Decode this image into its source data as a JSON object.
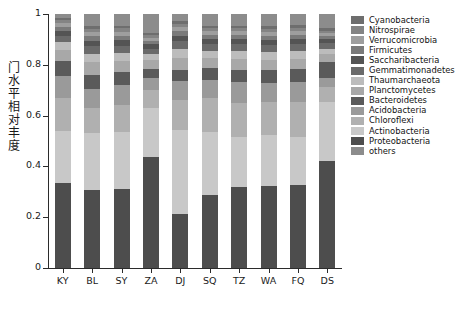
{
  "chart_data": {
    "type": "bar",
    "subtype": "stacked-bar-100-percent",
    "title": "",
    "xlabel": "",
    "ylabel": "门水平相对丰度",
    "ylim": [
      0,
      1
    ],
    "yticks": [
      "0",
      "0.2",
      "0.4",
      "0.6",
      "0.8",
      "1"
    ],
    "ytick_values": [
      0,
      0.2,
      0.4,
      0.6,
      0.8,
      1
    ],
    "grid": false,
    "legend_position": "right",
    "categories": [
      "KY",
      "BL",
      "SY",
      "ZA",
      "DJ",
      "SQ",
      "TZ",
      "WA",
      "FQ",
      "DS"
    ],
    "stack_order_bottom_to_top": [
      "Proteobacteria",
      "Actinobacteria",
      "Chloroflexi",
      "Acidobacteria",
      "Bacteroidetes",
      "Planctomycetes",
      "Thaumarchaeota",
      "Gemmatimonadetes",
      "Saccharibacteria",
      "Firmicutes",
      "Verrucomicrobia",
      "Nitrospirae",
      "Cyanobacteria",
      "others"
    ],
    "series": [
      {
        "name": "Proteobacteria",
        "color": "#4d4d4d",
        "values": [
          0.335,
          0.305,
          0.312,
          0.436,
          0.214,
          0.288,
          0.318,
          0.322,
          0.325,
          0.42
        ]
      },
      {
        "name": "Actinobacteria",
        "color": "#c8c8c8",
        "values": [
          0.205,
          0.226,
          0.222,
          0.194,
          0.33,
          0.246,
          0.196,
          0.202,
          0.192,
          0.235
        ]
      },
      {
        "name": "Chloroflexi",
        "color": "#b0b0b0",
        "values": [
          0.13,
          0.098,
          0.108,
          0.072,
          0.116,
          0.134,
          0.136,
          0.13,
          0.135,
          0.056
        ]
      },
      {
        "name": "Acidobacteria",
        "color": "#9a9a9a",
        "values": [
          0.085,
          0.075,
          0.078,
          0.046,
          0.075,
          0.07,
          0.081,
          0.074,
          0.08,
          0.036
        ]
      },
      {
        "name": "Bacteroidetes",
        "color": "#5a5a5a",
        "values": [
          0.059,
          0.057,
          0.05,
          0.036,
          0.043,
          0.048,
          0.048,
          0.05,
          0.05,
          0.064
        ]
      },
      {
        "name": "Planctomycetes",
        "color": "#a8a8a8",
        "values": [
          0.044,
          0.048,
          0.044,
          0.033,
          0.05,
          0.041,
          0.043,
          0.042,
          0.042,
          0.031
        ]
      },
      {
        "name": "Thaumarchaeota",
        "color": "#bcbcbc",
        "values": [
          0.03,
          0.034,
          0.032,
          0.024,
          0.035,
          0.029,
          0.031,
          0.03,
          0.03,
          0.022
        ]
      },
      {
        "name": "Gemmatimonadetes",
        "color": "#6a6a6a",
        "values": [
          0.026,
          0.03,
          0.029,
          0.022,
          0.03,
          0.026,
          0.027,
          0.027,
          0.027,
          0.02
        ]
      },
      {
        "name": "Saccharibacteria",
        "color": "#545454",
        "values": [
          0.02,
          0.022,
          0.022,
          0.017,
          0.022,
          0.02,
          0.021,
          0.021,
          0.021,
          0.016
        ]
      },
      {
        "name": "Firmicutes",
        "color": "#7a7a7a",
        "values": [
          0.016,
          0.018,
          0.018,
          0.014,
          0.018,
          0.016,
          0.017,
          0.017,
          0.017,
          0.013
        ]
      },
      {
        "name": "Verrucomicrobia",
        "color": "#9e9e9e",
        "values": [
          0.014,
          0.015,
          0.015,
          0.012,
          0.015,
          0.014,
          0.014,
          0.014,
          0.014,
          0.011
        ]
      },
      {
        "name": "Nitrospirae",
        "color": "#848484",
        "values": [
          0.012,
          0.013,
          0.013,
          0.01,
          0.013,
          0.012,
          0.012,
          0.012,
          0.012,
          0.01
        ]
      },
      {
        "name": "Cyanobacteria",
        "color": "#6e6e6e",
        "values": [
          0.01,
          0.011,
          0.011,
          0.009,
          0.011,
          0.01,
          0.01,
          0.01,
          0.01,
          0.009
        ]
      },
      {
        "name": "others",
        "color": "#8c8c8c",
        "values": [
          0.014,
          0.048,
          0.046,
          0.075,
          0.028,
          0.046,
          0.046,
          0.049,
          0.045,
          0.057
        ]
      }
    ]
  },
  "legend": {
    "items": [
      {
        "label": "Cyanobacteria",
        "color": "#6e6e6e"
      },
      {
        "label": "Nitrospirae",
        "color": "#848484"
      },
      {
        "label": "Verrucomicrobia",
        "color": "#9e9e9e"
      },
      {
        "label": "Firmicutes",
        "color": "#7a7a7a"
      },
      {
        "label": "Saccharibacteria",
        "color": "#545454"
      },
      {
        "label": "Gemmatimonadetes",
        "color": "#6a6a6a"
      },
      {
        "label": "Thaumarchaeota",
        "color": "#bcbcbc"
      },
      {
        "label": "Planctomycetes",
        "color": "#a8a8a8"
      },
      {
        "label": "Bacteroidetes",
        "color": "#5a5a5a"
      },
      {
        "label": "Acidobacteria",
        "color": "#9a9a9a"
      },
      {
        "label": "Chloroflexi",
        "color": "#b0b0b0"
      },
      {
        "label": "Actinobacteria",
        "color": "#c8c8c8"
      },
      {
        "label": "Proteobacteria",
        "color": "#4d4d4d"
      },
      {
        "label": "others",
        "color": "#8c8c8c"
      }
    ]
  },
  "axes": {
    "y_title_chars": [
      "门",
      "水",
      "平",
      "相",
      "对",
      "丰",
      "度"
    ],
    "axis_color": "#2b2b2b"
  }
}
